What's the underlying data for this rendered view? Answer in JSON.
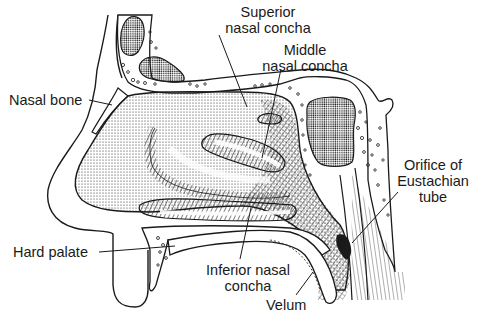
{
  "diagram": {
    "type": "anatomical-line-drawing",
    "ink_color": "#1a1a1a",
    "background_color": "#ffffff",
    "labels": {
      "superior_nasal_concha": {
        "line1": "Superior",
        "line2": "nasal concha"
      },
      "middle_nasal_concha": {
        "line1": "Middle",
        "line2": "nasal concha"
      },
      "nasal_bone": {
        "line1": "Nasal bone"
      },
      "orifice_eustachian_tube": {
        "line1": "Orifice of",
        "line2": "Eustachian",
        "line3": "tube"
      },
      "hard_palate": {
        "line1": "Hard palate"
      },
      "inferior_nasal_concha": {
        "line1": "Inferior nasal",
        "line2": "concha"
      },
      "velum": {
        "line1": "Velum"
      }
    }
  }
}
